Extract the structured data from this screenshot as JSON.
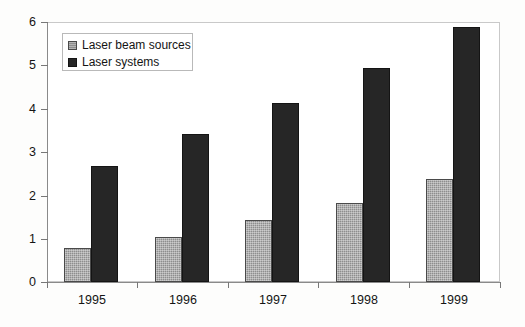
{
  "chart_data": {
    "type": "bar",
    "title": "",
    "subtitle": "",
    "xlabel": "",
    "ylabel": "",
    "categories": [
      "1995",
      "1996",
      "1997",
      "1998",
      "1999"
    ],
    "series": [
      {
        "name": "Laser beam sources",
        "color": "#8e8e8e",
        "values": [
          0.78,
          1.05,
          1.42,
          1.82,
          2.38
        ]
      },
      {
        "name": "Laser systems",
        "color": "#262626",
        "values": [
          2.68,
          3.42,
          4.12,
          4.95,
          5.88
        ]
      }
    ],
    "ylim": [
      0,
      6
    ],
    "yticks": [
      0,
      1,
      2,
      3,
      4,
      5,
      6
    ],
    "ytick_labels": [
      "0",
      "1",
      "2",
      "3",
      "4",
      "5",
      "6"
    ],
    "grid": false,
    "legend_position": "upper-left-inside"
  }
}
